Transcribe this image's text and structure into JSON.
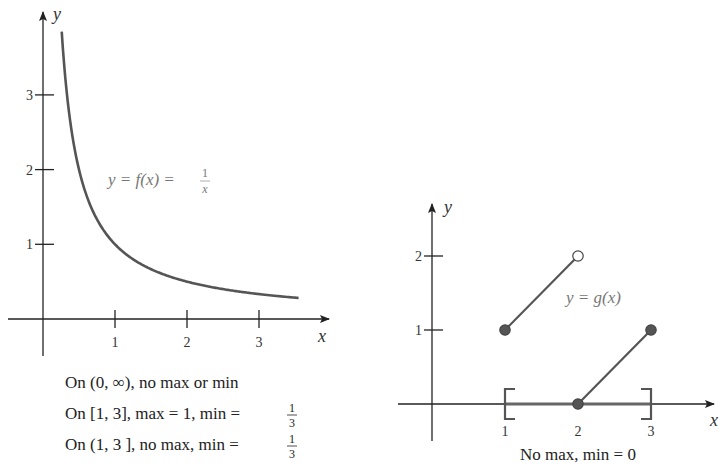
{
  "chart_data": [
    {
      "type": "line",
      "title": "",
      "xlabel": "x",
      "ylabel": "y",
      "xlim": [
        -0.5,
        3.9
      ],
      "ylim": [
        -0.5,
        4.2
      ],
      "x_ticks": [
        1,
        2,
        3
      ],
      "y_ticks": [
        1,
        2,
        3
      ],
      "x_tick_labels": [
        "1",
        "2",
        "3"
      ],
      "y_tick_labels": [
        "1",
        "2",
        "3"
      ],
      "grid": false,
      "series": [
        {
          "name": "f(x) = 1/x",
          "function": "1/x",
          "domain": [
            0.26,
            3.55
          ]
        }
      ],
      "annotation": {
        "lhs": "y = f(x) = ",
        "frac_num": "1",
        "frac_den": "x"
      },
      "captions": [
        {
          "text": "On (0, ∞), no max or min"
        },
        {
          "text": "On [1, 3], max = 1, min = ",
          "frac_num": "1",
          "frac_den": "3"
        },
        {
          "text": "On (1, 3 ], no max, min = ",
          "frac_num": "1",
          "frac_den": "3"
        }
      ]
    },
    {
      "type": "line",
      "title": "",
      "xlabel": "x",
      "ylabel": "y",
      "xlim": [
        -0.5,
        4.2
      ],
      "ylim": [
        -0.55,
        2.6
      ],
      "x_ticks": [
        1,
        2,
        3
      ],
      "y_ticks": [
        1,
        2
      ],
      "x_tick_labels": [
        "1",
        "2",
        "3"
      ],
      "y_tick_labels": [
        "1",
        "2"
      ],
      "grid": false,
      "segments": [
        {
          "name": "segment-1",
          "x": [
            1,
            2
          ],
          "y": [
            1,
            2
          ],
          "start_closed": true,
          "end_closed": false
        },
        {
          "name": "segment-2",
          "x": [
            2,
            3
          ],
          "y": [
            0,
            1
          ],
          "start_closed": true,
          "end_closed": true
        }
      ],
      "interval": {
        "left": 1,
        "right": 3,
        "left_bracket": "[",
        "right_bracket": "]"
      },
      "annotation": "y = g(x)",
      "captions": [
        {
          "text": "No max, min = 0"
        }
      ]
    }
  ],
  "colors": {
    "curve": "#555555",
    "axis": "#222222",
    "point_fill": "#555555",
    "label": "#777777"
  }
}
